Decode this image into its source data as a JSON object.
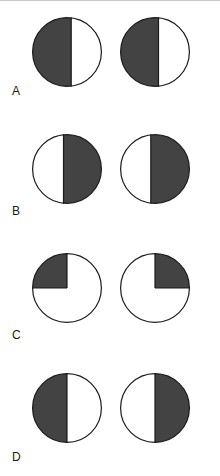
{
  "figure": {
    "background_color": "#ffffff",
    "shade_color": "#434343",
    "unshaded_color": "#ffffff",
    "outline_color": "#1a1a1a",
    "outline_width": 1.2,
    "circle_diameter": 70,
    "rows": [
      {
        "label": "A",
        "circles": [
          {
            "name": "circle-a-left",
            "shape": "vertical-split",
            "shaded_side": "left",
            "shaded_fraction": 0.56,
            "split_x": 0.56
          },
          {
            "name": "circle-a-right",
            "shape": "vertical-split",
            "shaded_side": "left",
            "shaded_fraction": 0.55,
            "split_x": 0.55
          }
        ]
      },
      {
        "label": "B",
        "circles": [
          {
            "name": "circle-b-left",
            "shape": "vertical-split",
            "shaded_side": "right",
            "shaded_fraction": 0.55,
            "split_x": 0.45
          },
          {
            "name": "circle-b-right",
            "shape": "vertical-split",
            "shaded_side": "right",
            "shaded_fraction": 0.56,
            "split_x": 0.44
          }
        ]
      },
      {
        "label": "C",
        "circles": [
          {
            "name": "circle-c-left",
            "shape": "quadrant",
            "shaded_quadrant": "upper-left",
            "shaded_fraction": 0.25
          },
          {
            "name": "circle-c-right",
            "shape": "quadrant",
            "shaded_quadrant": "upper-right",
            "shaded_fraction": 0.25
          }
        ]
      },
      {
        "label": "D",
        "circles": [
          {
            "name": "circle-d-left",
            "shape": "vertical-split",
            "shaded_side": "left",
            "shaded_fraction": 0.5,
            "split_x": 0.5
          },
          {
            "name": "circle-d-right",
            "shape": "vertical-split",
            "shaded_side": "right",
            "shaded_fraction": 0.5,
            "split_x": 0.5
          }
        ]
      }
    ]
  }
}
